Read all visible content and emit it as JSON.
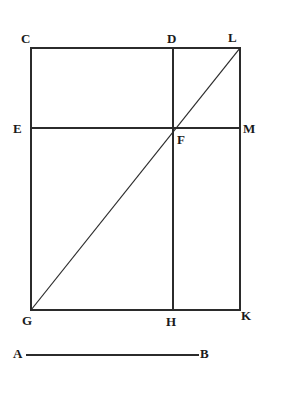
{
  "figure": {
    "background_color": "#ffffff",
    "ink_color": "#2b2b2b",
    "label_color": "#1a1a1a",
    "canvas": {
      "width": 282,
      "height": 394
    },
    "vertices": [
      {
        "id": "C",
        "label": "C",
        "name": "vertex-label-c",
        "x": 31,
        "y": 48,
        "label_x": 21,
        "label_y": 32,
        "role": "rectangle-top-left"
      },
      {
        "id": "D",
        "label": "D",
        "name": "vertex-label-d",
        "x": 173,
        "y": 48,
        "label_x": 167,
        "label_y": 32,
        "role": "top-midpoint"
      },
      {
        "id": "L",
        "label": "L",
        "name": "vertex-label-l",
        "x": 240,
        "y": 48,
        "label_x": 228,
        "label_y": 31,
        "role": "rectangle-top-right"
      },
      {
        "id": "E",
        "label": "E",
        "name": "vertex-label-e",
        "x": 31,
        "y": 128,
        "label_x": 13,
        "label_y": 122,
        "role": "left-midpoint"
      },
      {
        "id": "F",
        "label": "F",
        "name": "vertex-label-f",
        "x": 173,
        "y": 128,
        "label_x": 177,
        "label_y": 133,
        "role": "center-intersection"
      },
      {
        "id": "M",
        "label": "M",
        "name": "vertex-label-m",
        "x": 240,
        "y": 128,
        "label_x": 243,
        "label_y": 122,
        "role": "right-midpoint"
      },
      {
        "id": "G",
        "label": "G",
        "name": "vertex-label-g",
        "x": 31,
        "y": 310,
        "label_x": 22,
        "label_y": 314,
        "role": "rectangle-bottom-left"
      },
      {
        "id": "H",
        "label": "H",
        "name": "vertex-label-h",
        "x": 173,
        "y": 310,
        "label_x": 166,
        "label_y": 315,
        "role": "bottom-midpoint"
      },
      {
        "id": "K",
        "label": "K",
        "name": "vertex-label-k",
        "x": 240,
        "y": 310,
        "label_x": 241,
        "label_y": 309,
        "role": "rectangle-bottom-right"
      },
      {
        "id": "A",
        "label": "A",
        "name": "vertex-label-a",
        "x": 27,
        "y": 355,
        "label_x": 13,
        "label_y": 347,
        "role": "segment-left-end"
      },
      {
        "id": "B",
        "label": "B",
        "name": "vertex-label-b",
        "x": 198,
        "y": 355,
        "label_x": 200,
        "label_y": 347,
        "role": "segment-right-end"
      }
    ],
    "segments": [
      {
        "id": "CL",
        "name": "segment-cl-top-edge",
        "from": "C",
        "to": "L",
        "x1": 31,
        "y1": 48,
        "x2": 240,
        "y2": 48,
        "kind": "rectangle-edge"
      },
      {
        "id": "LK",
        "name": "segment-lk-right-edge",
        "from": "L",
        "to": "K",
        "x1": 240,
        "y1": 48,
        "x2": 240,
        "y2": 310,
        "kind": "rectangle-edge"
      },
      {
        "id": "GK",
        "name": "segment-gk-bottom-edge",
        "from": "G",
        "to": "K",
        "x1": 31,
        "y1": 310,
        "x2": 240,
        "y2": 310,
        "kind": "rectangle-edge"
      },
      {
        "id": "CG",
        "name": "segment-cg-left-edge",
        "from": "C",
        "to": "G",
        "x1": 31,
        "y1": 48,
        "x2": 31,
        "y2": 310,
        "kind": "rectangle-edge"
      },
      {
        "id": "DH",
        "name": "segment-dh-vertical",
        "from": "D",
        "to": "H",
        "x1": 173,
        "y1": 48,
        "x2": 173,
        "y2": 310,
        "kind": "interior-line"
      },
      {
        "id": "EM",
        "name": "segment-em-horizontal",
        "from": "E",
        "to": "M",
        "x1": 31,
        "y1": 128,
        "x2": 240,
        "y2": 128,
        "kind": "interior-line"
      },
      {
        "id": "GL",
        "name": "segment-gl-diagonal",
        "from": "G",
        "to": "L",
        "x1": 31,
        "y1": 310,
        "x2": 240,
        "y2": 48,
        "kind": "diagonal"
      },
      {
        "id": "AB",
        "name": "segment-ab-reference",
        "from": "A",
        "to": "B",
        "x1": 27,
        "y1": 355,
        "x2": 198,
        "y2": 355,
        "kind": "reference-segment"
      }
    ]
  }
}
